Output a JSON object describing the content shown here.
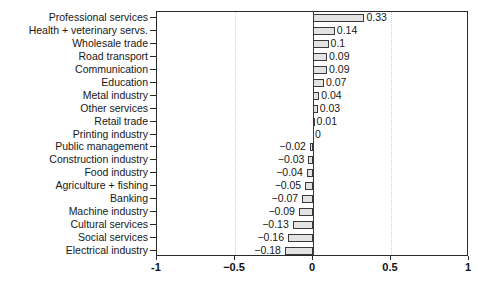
{
  "chart_data": {
    "type": "bar",
    "orientation": "horizontal",
    "title": "",
    "xlabel": "",
    "ylabel": "",
    "xlim": [
      -1,
      1
    ],
    "xticks": [
      -1,
      -0.5,
      0,
      0.5,
      1
    ],
    "xticklabels": [
      "-1",
      "−0.5",
      "0",
      "0.5",
      "1"
    ],
    "grid": "vertical dotted at -0.5 and 0.5",
    "legend": "none",
    "categories": [
      "Professional services",
      "Health + veterinary servs.",
      "Wholesale trade",
      "Road transport",
      "Communication",
      "Education",
      "Metal industry",
      "Other services",
      "Retail trade",
      "Printing industry",
      "Public management",
      "Construction industry",
      "Food industry",
      "Agriculture + fishing",
      "Banking",
      "Machine industry",
      "Cultural services",
      "Social services",
      "Electrical industry"
    ],
    "values": [
      0.33,
      0.14,
      0.1,
      0.09,
      0.09,
      0.07,
      0.04,
      0.03,
      0.01,
      0,
      -0.02,
      -0.03,
      -0.04,
      -0.05,
      -0.07,
      -0.09,
      -0.13,
      -0.16,
      -0.18
    ],
    "value_labels": [
      "0.33",
      "0.14",
      "0.1",
      "0.09",
      "0.09",
      "0.07",
      "0.04",
      "0.03",
      "0.01",
      "0",
      "−0.02",
      "−0.03",
      "−0.04",
      "−0.05",
      "−0.07",
      "−0.09",
      "−0.13",
      "−0.16",
      "−0.18"
    ],
    "bar_face_color": "#e3e3e3",
    "bar_edge_color": "#3a3a3a"
  }
}
